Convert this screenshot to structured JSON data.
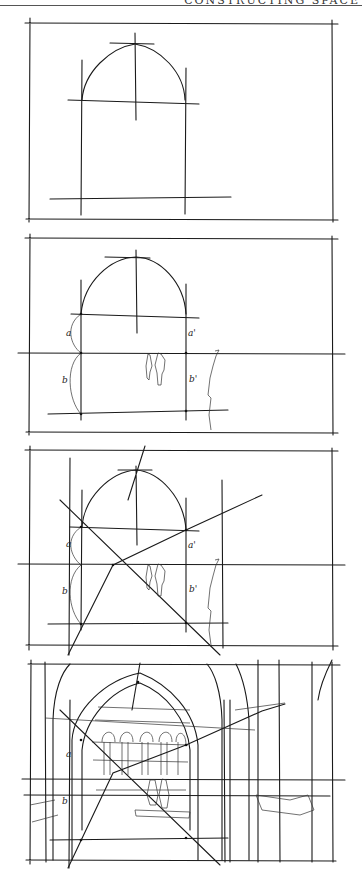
{
  "header": {
    "text": "CONSTRUCTING SPACE"
  },
  "figure": {
    "type": "perspective-construction-sketch",
    "panels": [
      {
        "step": 1,
        "frame": [
          29,
          22,
          336,
          219
        ],
        "description": "pointed arch outline with springline and base guideline"
      },
      {
        "step": 2,
        "frame": [
          29,
          237,
          336,
          432
        ],
        "description": "horizon line added, arch subdivided with measures a/b and a'/b', two human figures for scale",
        "labels": [
          "a",
          "b",
          "a'",
          "b'"
        ]
      },
      {
        "step": 3,
        "frame": [
          29,
          449,
          336,
          646
        ],
        "description": "diagonals drawn through the measure points to locate depth",
        "labels": [
          "a",
          "b",
          "a'",
          "b'"
        ]
      },
      {
        "step": 4,
        "frame": [
          29,
          663,
          336,
          860
        ],
        "description": "fully developed interior perspective through the arch with arcaded facade beyond",
        "labels": [
          "a",
          "b"
        ]
      }
    ]
  }
}
